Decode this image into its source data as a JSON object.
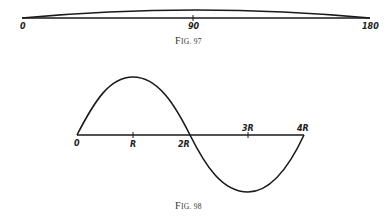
{
  "figures": [
    {
      "caption": "Fig. 97",
      "caption_small_caps": "IG.",
      "axis_labels": [
        "0",
        "90",
        "180"
      ],
      "description": "Very flat arch over a baseline from 0 to 180"
    },
    {
      "caption": "Fig. 98",
      "axis_labels": [
        "0",
        "R",
        "2R",
        "3R",
        "4R"
      ],
      "description": "One full sine-like wave: positive hump from 0 to 2R peaking at R, negative trough from 2R to 4R bottoming at 3R"
    }
  ],
  "fig97": {
    "label_0": "0",
    "label_90": "90",
    "label_180": "180",
    "caption_F": "F",
    "caption_rest": "IG. 97"
  },
  "fig98": {
    "label_0": "0",
    "label_R": "R",
    "label_2R": "2R",
    "label_3R": "3R",
    "label_4R": "4R",
    "caption_F": "F",
    "caption_rest": "IG. 98"
  }
}
